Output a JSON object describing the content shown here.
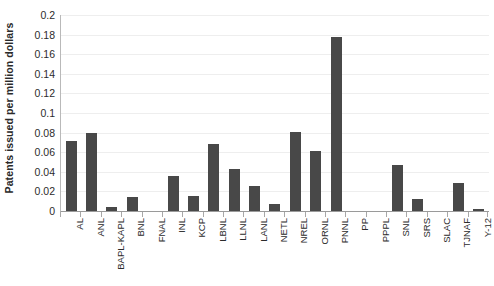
{
  "chart_data": {
    "type": "bar",
    "title": "",
    "subtitle": "",
    "xlabel": "",
    "ylabel": "Patents issued per million dollars",
    "ylim": [
      0,
      0.2
    ],
    "ytick_step": 0.02,
    "ytick_labels": [
      "0",
      "0.02",
      "0.04",
      "0.06",
      "0.08",
      "0.1",
      "0.12",
      "0.14",
      "0.16",
      "0.18",
      "0.2"
    ],
    "ytick_values": [
      0,
      0.02,
      0.04,
      0.06,
      0.08,
      0.1,
      0.12,
      0.14,
      0.16,
      0.18,
      0.2
    ],
    "grid": true,
    "grid_axis": "y",
    "legend": false,
    "legend_position": "none",
    "bar_color": "#484848",
    "categories": [
      "AL",
      "ANL",
      "BAPL-KAPL",
      "BNL",
      "FNAL",
      "INL",
      "KCP",
      "LBNL",
      "LLNL",
      "LANL",
      "NETL",
      "NREL",
      "ORNL",
      "PNNL",
      "PP",
      "PPPL",
      "SNL",
      "SRS",
      "SLAC",
      "TJNAF",
      "Y-12"
    ],
    "values": [
      0.071,
      0.08,
      0.004,
      0.014,
      0.0,
      0.036,
      0.015,
      0.068,
      0.043,
      0.026,
      0.007,
      0.081,
      0.061,
      0.178,
      0.0,
      0.0,
      0.047,
      0.012,
      0.0,
      0.029,
      0.002
    ]
  }
}
